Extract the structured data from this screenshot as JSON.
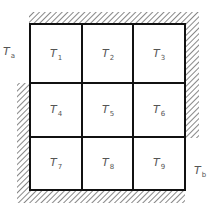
{
  "diagram": {
    "type": "grid-of-nodes",
    "colors": {
      "grid_line": "#111111",
      "hatch": "#555555",
      "label": "#555555",
      "background": "#ffffff"
    },
    "grid": {
      "rows": 3,
      "cols": 3,
      "cells": [
        [
          {
            "symbol": "T",
            "sub": "1"
          },
          {
            "symbol": "T",
            "sub": "2"
          },
          {
            "symbol": "T",
            "sub": "3"
          }
        ],
        [
          {
            "symbol": "T",
            "sub": "4"
          },
          {
            "symbol": "T",
            "sub": "5"
          },
          {
            "symbol": "T",
            "sub": "6"
          }
        ],
        [
          {
            "symbol": "T",
            "sub": "7"
          },
          {
            "symbol": "T",
            "sub": "8"
          },
          {
            "symbol": "T",
            "sub": "9"
          }
        ]
      ]
    },
    "boundaries": {
      "top": "insulated",
      "right_upper": "insulated",
      "left_lower": "insulated",
      "bottom": "insulated"
    },
    "external_labels": {
      "left": {
        "symbol": "T",
        "sub": "a"
      },
      "right": {
        "symbol": "T",
        "sub": "b"
      }
    }
  }
}
